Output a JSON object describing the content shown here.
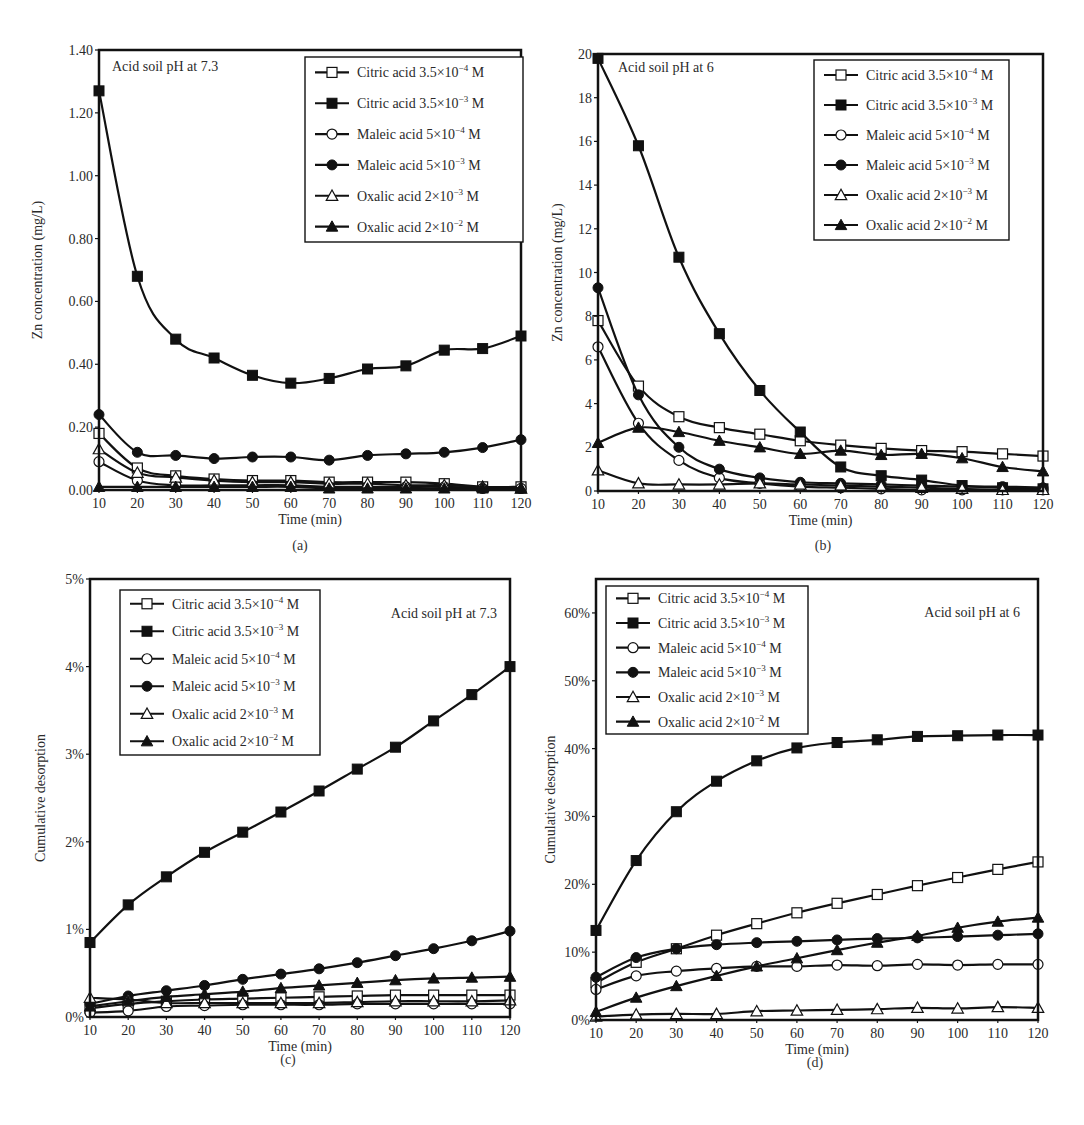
{
  "figure": {
    "captions": [
      "(a)",
      "(b)",
      "(c)",
      "(d)"
    ]
  },
  "legend_labels": [
    {
      "base": "Citric acid 3.5×10",
      "exp": "−4",
      "unit": " M",
      "marker": "square-open"
    },
    {
      "base": "Citric acid 3.5×10",
      "exp": "−3",
      "unit": " M",
      "marker": "square-filled"
    },
    {
      "base": "Maleic acid 5×10",
      "exp": "−4",
      "unit": " M",
      "marker": "circle-open"
    },
    {
      "base": "Maleic acid 5×10",
      "exp": "−3",
      "unit": " M",
      "marker": "circle-filled"
    },
    {
      "base": "Oxalic acid 2×10",
      "exp": "−3",
      "unit": " M",
      "marker": "triangle-open"
    },
    {
      "base": "Oxalic acid 2×10",
      "exp": "−2",
      "unit": " M",
      "marker": "triangle-filled"
    }
  ],
  "chart_data": [
    {
      "id": "a",
      "type": "line",
      "annotation": "Acid soil pH at 7.3",
      "xlabel": "Time (min)",
      "ylabel": "Zn concentration (mg/L)",
      "x": [
        10,
        20,
        30,
        40,
        50,
        60,
        70,
        80,
        90,
        100,
        110,
        120
      ],
      "xlim": [
        10,
        120
      ],
      "ylim": [
        0,
        1.4
      ],
      "yticks": [
        0,
        0.2,
        0.4,
        0.6,
        0.8,
        1.0,
        1.2,
        1.4
      ],
      "ytick_labels": [
        "0.00",
        "0.20",
        "0.40",
        "0.60",
        "0.80",
        "1.00",
        "1.20",
        "1.40"
      ],
      "grid": false,
      "legend_position": "upper-right",
      "series": [
        {
          "name": "Citric acid 3.5×10⁻⁴ M",
          "values": [
            0.18,
            0.07,
            0.045,
            0.035,
            0.03,
            0.03,
            0.025,
            0.025,
            0.025,
            0.02,
            0.01,
            0.01
          ]
        },
        {
          "name": "Citric acid 3.5×10⁻³ M",
          "values": [
            1.27,
            0.68,
            0.48,
            0.42,
            0.365,
            0.34,
            0.355,
            0.385,
            0.395,
            0.445,
            0.45,
            0.49
          ]
        },
        {
          "name": "Maleic acid 5×10⁻⁴ M",
          "values": [
            0.09,
            0.03,
            0.015,
            0.015,
            0.015,
            0.015,
            0.01,
            0.01,
            0.01,
            0.01,
            0.005,
            0.005
          ]
        },
        {
          "name": "Maleic acid 5×10⁻³ M",
          "values": [
            0.24,
            0.12,
            0.11,
            0.1,
            0.105,
            0.105,
            0.095,
            0.11,
            0.115,
            0.12,
            0.135,
            0.16
          ]
        },
        {
          "name": "Oxalic acid 2×10⁻³ M",
          "values": [
            0.13,
            0.055,
            0.04,
            0.03,
            0.025,
            0.025,
            0.02,
            0.02,
            0.015,
            0.015,
            0.01,
            0.005
          ]
        },
        {
          "name": "Oxalic acid 2×10⁻² M",
          "values": [
            0.01,
            0.01,
            0.01,
            0.01,
            0.01,
            0.01,
            0.005,
            0.005,
            0.005,
            0.005,
            0.005,
            0.005
          ]
        }
      ]
    },
    {
      "id": "b",
      "type": "line",
      "annotation": "Acid soil pH at 6",
      "xlabel": "Time (min)",
      "ylabel": "Zn concentration (mg/L)",
      "x": [
        10,
        20,
        30,
        40,
        50,
        60,
        70,
        80,
        90,
        100,
        110,
        120
      ],
      "xlim": [
        10,
        120
      ],
      "ylim": [
        0,
        20
      ],
      "yticks": [
        0,
        2,
        4,
        6,
        8,
        10,
        12,
        14,
        16,
        18,
        20
      ],
      "ytick_labels": [
        "0",
        "2",
        "4",
        "6",
        "8",
        "10",
        "12",
        "14",
        "16",
        "18",
        "20"
      ],
      "grid": false,
      "legend_position": "upper-right",
      "series": [
        {
          "name": "Citric acid 3.5×10⁻⁴ M",
          "values": [
            7.8,
            4.8,
            3.4,
            2.9,
            2.6,
            2.3,
            2.1,
            1.95,
            1.85,
            1.8,
            1.7,
            1.6
          ]
        },
        {
          "name": "Citric acid 3.5×10⁻³ M",
          "values": [
            19.8,
            15.8,
            10.7,
            7.2,
            4.6,
            2.7,
            1.1,
            0.7,
            0.5,
            0.25,
            0.15,
            0.1
          ]
        },
        {
          "name": "Maleic acid 5×10⁻⁴ M",
          "values": [
            6.6,
            3.1,
            1.4,
            0.6,
            0.35,
            0.2,
            0.15,
            0.1,
            0.05,
            0.05,
            0.05,
            0.05
          ]
        },
        {
          "name": "Maleic acid 5×10⁻³ M",
          "values": [
            9.3,
            4.4,
            2.0,
            1.0,
            0.6,
            0.4,
            0.35,
            0.3,
            0.25,
            0.2,
            0.2,
            0.15
          ]
        },
        {
          "name": "Oxalic acid 2×10⁻³ M",
          "values": [
            0.95,
            0.35,
            0.3,
            0.3,
            0.35,
            0.3,
            0.25,
            0.2,
            0.15,
            0.1,
            0.05,
            0.05
          ]
        },
        {
          "name": "Oxalic acid 2×10⁻² M",
          "values": [
            2.2,
            2.9,
            2.7,
            2.3,
            2.0,
            1.7,
            1.85,
            1.65,
            1.7,
            1.5,
            1.1,
            0.9
          ]
        }
      ]
    },
    {
      "id": "c",
      "type": "line",
      "annotation": "Acid soil pH at 7.3",
      "xlabel": "Time (min)",
      "ylabel": "Cumulative desorption",
      "x": [
        10,
        20,
        30,
        40,
        50,
        60,
        70,
        80,
        90,
        100,
        110,
        120
      ],
      "xlim": [
        10,
        120
      ],
      "ylim": [
        0,
        5
      ],
      "yticks": [
        0,
        1,
        2,
        3,
        4,
        5
      ],
      "ytick_labels": [
        "0%",
        "1%",
        "2%",
        "3%",
        "4%",
        "5%"
      ],
      "unit": "%",
      "grid": false,
      "legend_position": "upper-left",
      "series": [
        {
          "name": "Citric acid 3.5×10⁻⁴ M",
          "values": [
            0.1,
            0.15,
            0.18,
            0.2,
            0.21,
            0.22,
            0.23,
            0.24,
            0.25,
            0.25,
            0.25,
            0.25
          ]
        },
        {
          "name": "Citric acid 3.5×10⁻³ M",
          "values": [
            0.85,
            1.28,
            1.6,
            1.88,
            2.11,
            2.34,
            2.58,
            2.83,
            3.08,
            3.38,
            3.68,
            4.0
          ]
        },
        {
          "name": "Maleic acid 5×10⁻⁴ M",
          "values": [
            0.05,
            0.07,
            0.12,
            0.13,
            0.14,
            0.14,
            0.14,
            0.15,
            0.15,
            0.15,
            0.15,
            0.15
          ]
        },
        {
          "name": "Maleic acid 5×10⁻³ M",
          "values": [
            0.15,
            0.24,
            0.3,
            0.36,
            0.43,
            0.49,
            0.55,
            0.62,
            0.7,
            0.78,
            0.87,
            0.98
          ]
        },
        {
          "name": "Oxalic acid 2×10⁻³ M",
          "values": [
            0.22,
            0.2,
            0.16,
            0.16,
            0.16,
            0.16,
            0.16,
            0.17,
            0.18,
            0.18,
            0.18,
            0.19
          ]
        },
        {
          "name": "Oxalic acid 2×10⁻² M",
          "values": [
            0.12,
            0.18,
            0.23,
            0.26,
            0.29,
            0.33,
            0.36,
            0.39,
            0.42,
            0.44,
            0.45,
            0.46
          ]
        }
      ]
    },
    {
      "id": "d",
      "type": "line",
      "annotation": "Acid soil pH at 6",
      "xlabel": "Time (min)",
      "ylabel": "Cumulative desorption",
      "x": [
        10,
        20,
        30,
        40,
        50,
        60,
        70,
        80,
        90,
        100,
        110,
        120
      ],
      "xlim": [
        10,
        120
      ],
      "ylim": [
        0,
        65
      ],
      "yticks": [
        0,
        10,
        20,
        30,
        40,
        50,
        60
      ],
      "ytick_labels": [
        "0%",
        "10%",
        "20%",
        "30%",
        "40%",
        "50%",
        "60%"
      ],
      "unit": "%",
      "grid": false,
      "legend_position": "upper-left",
      "series": [
        {
          "name": "Citric acid 3.5×10⁻⁴ M",
          "values": [
            5.5,
            8.5,
            10.5,
            12.5,
            14.2,
            15.8,
            17.2,
            18.5,
            19.8,
            21.0,
            22.2,
            23.3
          ]
        },
        {
          "name": "Citric acid 3.5×10⁻³ M",
          "values": [
            13.2,
            23.5,
            30.7,
            35.2,
            38.2,
            40.1,
            40.9,
            41.3,
            41.8,
            41.9,
            42.0,
            42.0
          ]
        },
        {
          "name": "Maleic acid 5×10⁻⁴ M",
          "values": [
            4.5,
            6.5,
            7.2,
            7.6,
            7.9,
            7.9,
            8.1,
            8.0,
            8.2,
            8.1,
            8.2,
            8.2
          ]
        },
        {
          "name": "Maleic acid 5×10⁻³ M",
          "values": [
            6.3,
            9.2,
            10.5,
            11.1,
            11.4,
            11.6,
            11.8,
            12.0,
            12.1,
            12.3,
            12.5,
            12.7
          ]
        },
        {
          "name": "Oxalic acid 2×10⁻³ M",
          "values": [
            0.5,
            0.8,
            0.9,
            0.9,
            1.3,
            1.4,
            1.5,
            1.6,
            1.8,
            1.7,
            1.9,
            1.8
          ]
        },
        {
          "name": "Oxalic acid 2×10⁻² M",
          "values": [
            1.2,
            3.3,
            5.0,
            6.5,
            7.9,
            9.1,
            10.3,
            11.4,
            12.4,
            13.6,
            14.5,
            15.1
          ]
        }
      ]
    }
  ]
}
